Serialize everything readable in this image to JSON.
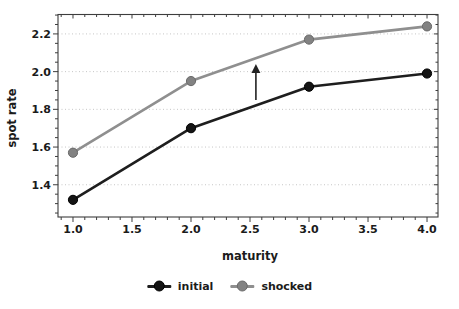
{
  "chart_data": {
    "type": "line",
    "title": "",
    "xlabel": "maturity",
    "ylabel": "spot rate",
    "x": [
      1.0,
      2.0,
      3.0,
      4.0
    ],
    "series": [
      {
        "name": "initial",
        "values": [
          1.32,
          1.7,
          1.92,
          1.99
        ],
        "line_color": "#1e1e1e",
        "marker_color": "#141414",
        "marker_edge": "#000000"
      },
      {
        "name": "shocked",
        "values": [
          1.57,
          1.95,
          2.17,
          2.24
        ],
        "line_color": "#8f8f8f",
        "marker_color": "#828282",
        "marker_edge": "#6a6a6a"
      }
    ],
    "xlim": [
      0.873,
      4.093
    ],
    "ylim": [
      1.229,
      2.303
    ],
    "x_major_ticks": [
      1.0,
      1.5,
      2.0,
      2.5,
      3.0,
      3.5,
      4.0
    ],
    "y_major_ticks": [
      1.4,
      1.6,
      1.8,
      2.0,
      2.2
    ],
    "x_minor_step": 0.1,
    "y_minor_step": 0.05,
    "tick_label_decimals": 1,
    "grid": "horizontal-dotted",
    "grid_color": "#c6c6c6",
    "legend_position": "bottom-center",
    "annotation": {
      "type": "up-arrow",
      "x": 2.55,
      "y_from": 1.85,
      "y_to": 2.04,
      "color": "#222222"
    }
  }
}
